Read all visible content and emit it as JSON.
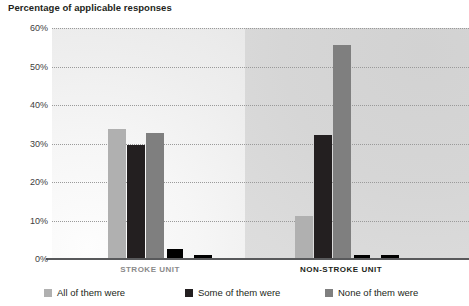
{
  "title": "Percentage of applicable responses",
  "colors": {
    "series_all": "#b0b0b0",
    "series_some": "#231f20",
    "series_none": "#7f7f7f",
    "series_extra": "#000000",
    "axis": "#58595b",
    "gridline": "#9a9a9a",
    "panel_left": "#f4f4f4",
    "panel_right": "#d8d8d8",
    "label_inactive": "#8a8a8a",
    "label_active": "#231f20"
  },
  "y_axis": {
    "labels": [
      "60%",
      "50%",
      "40%",
      "30%",
      "20%",
      "10%",
      "0%"
    ],
    "values": [
      60,
      50,
      40,
      30,
      20,
      10,
      0
    ]
  },
  "legend": {
    "items": [
      {
        "label": "All of them were",
        "swatch_name": "legend-swatch-all",
        "color": "#b0b0b0"
      },
      {
        "label": "Some of them were",
        "swatch_name": "legend-swatch-some",
        "color": "#231f20"
      },
      {
        "label": "None of them were",
        "swatch_name": "legend-swatch-none",
        "color": "#7f7f7f"
      }
    ]
  },
  "chart_data": {
    "type": "bar",
    "title": "Percentage of applicable responses",
    "xlabel": "",
    "ylabel": "Percentage of applicable responses",
    "ylim": [
      0,
      60
    ],
    "ytick_labels": [
      "0%",
      "10%",
      "20%",
      "30%",
      "40%",
      "50%",
      "60%"
    ],
    "grid": true,
    "legend_position": "bottom",
    "categories": [
      "STROKE UNIT",
      "NON-STROKE UNIT"
    ],
    "series": [
      {
        "name": "All of them were",
        "color": "#b0b0b0",
        "values": [
          33.8,
          11.3
        ]
      },
      {
        "name": "Some of them were",
        "color": "#231f20",
        "values": [
          29.5,
          32.2
        ]
      },
      {
        "name": "None of them were",
        "color": "#7f7f7f",
        "values": [
          32.8,
          55.5
        ]
      },
      {
        "name": "",
        "color": "#000000",
        "values": [
          2.6,
          1.1
        ]
      },
      {
        "name": "",
        "color": "#000000",
        "values": [
          1.0,
          1.0
        ]
      }
    ]
  }
}
